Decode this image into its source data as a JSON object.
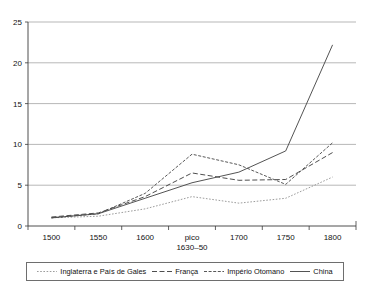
{
  "chart_data": {
    "type": "line",
    "title": "",
    "subtitle": "",
    "xlabel": "",
    "ylabel": "",
    "xlim": [
      0,
      6
    ],
    "ylim": [
      0,
      25
    ],
    "yticks": [
      "0",
      "5",
      "10",
      "15",
      "20",
      "25"
    ],
    "ytick_values": [
      0,
      5,
      10,
      15,
      20,
      25
    ],
    "grid": true,
    "legend_position": "bottom",
    "categories": [
      "1500",
      "1550",
      "1600",
      "pico",
      "1700",
      "1750",
      "1800"
    ],
    "category_sublabels": [
      "",
      "",
      "",
      "1630–50",
      "",
      "",
      ""
    ],
    "series": [
      {
        "name": "Inglaterra e País de Gales",
        "style": "dotted",
        "color": "#8a8a8a",
        "values": [
          1.0,
          1.2,
          2.1,
          3.6,
          2.8,
          3.4,
          6.0
        ]
      },
      {
        "name": "França",
        "style": "dashed",
        "color": "#2e2e2e",
        "values": [
          1.1,
          1.6,
          3.6,
          6.5,
          5.6,
          5.7,
          9.0
        ]
      },
      {
        "name": "Império Otomano",
        "style": "dash-dot",
        "color": "#3a3a3a",
        "values": [
          1.0,
          1.5,
          4.0,
          8.8,
          7.5,
          5.1,
          10.2
        ]
      },
      {
        "name": "China",
        "style": "solid",
        "color": "#4a4a4a",
        "values": [
          1.0,
          1.5,
          3.4,
          5.3,
          6.6,
          9.2,
          22.2
        ]
      }
    ]
  },
  "legend": {
    "items": [
      {
        "label": "Inglaterra e País de Gales"
      },
      {
        "label": "França"
      },
      {
        "label": "Império Otomano"
      },
      {
        "label": "China"
      }
    ]
  }
}
